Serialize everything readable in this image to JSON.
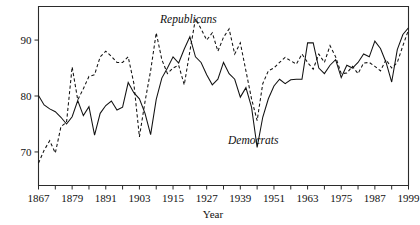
{
  "chart_data": {
    "type": "line",
    "title": "",
    "xlabel": "Year",
    "ylabel": "",
    "xlim": [
      1867,
      1999
    ],
    "ylim": [
      64,
      96
    ],
    "grid": false,
    "legend_position": "inline-annotation",
    "y_ticks": [
      70,
      80,
      90
    ],
    "x_ticks": [
      1867,
      1879,
      1891,
      1903,
      1915,
      1927,
      1939,
      1951,
      1963,
      1975,
      1987,
      1999
    ],
    "x_minor_ticks": [
      1873,
      1885,
      1897,
      1909,
      1921,
      1933,
      1945,
      1957,
      1969,
      1981,
      1993
    ],
    "x": [
      1867,
      1869,
      1871,
      1873,
      1875,
      1877,
      1879,
      1881,
      1883,
      1885,
      1887,
      1889,
      1891,
      1893,
      1895,
      1897,
      1899,
      1901,
      1903,
      1905,
      1907,
      1909,
      1911,
      1913,
      1915,
      1917,
      1919,
      1921,
      1923,
      1925,
      1927,
      1929,
      1931,
      1933,
      1935,
      1937,
      1939,
      1941,
      1943,
      1945,
      1947,
      1949,
      1951,
      1953,
      1955,
      1957,
      1959,
      1961,
      1963,
      1965,
      1967,
      1969,
      1971,
      1973,
      1975,
      1977,
      1979,
      1981,
      1983,
      1985,
      1987,
      1989,
      1991,
      1993,
      1995,
      1997,
      1999
    ],
    "series": [
      {
        "name": "Democrats",
        "style": "solid",
        "annotation": "Democrats",
        "values": [
          80.1,
          78.4,
          77.7,
          77.2,
          76.2,
          75.0,
          76.3,
          79.2,
          76.5,
          78.1,
          73.0,
          76.9,
          78.3,
          79.1,
          77.5,
          78.0,
          82.4,
          80.6,
          79.5,
          76.9,
          73.1,
          79.4,
          83.2,
          85.0,
          87.0,
          85.9,
          88.4,
          90.6,
          87.0,
          86.0,
          83.8,
          82.0,
          83.0,
          86.0,
          84.0,
          83.0,
          79.8,
          81.5,
          78.0,
          70.8,
          76.2,
          79.5,
          81.8,
          83.0,
          82.2,
          82.9,
          83.0,
          83.0,
          89.5,
          89.5,
          85.0,
          84.0,
          85.5,
          86.5,
          83.3,
          85.5,
          85.0,
          86.0,
          87.5,
          87.0,
          89.8,
          88.5,
          86.0,
          82.5,
          88.3,
          91.0,
          92.2
        ]
      },
      {
        "name": "Republicans",
        "style": "dashed",
        "annotation": "Republicans",
        "values": [
          68.0,
          70.3,
          72.0,
          69.8,
          74.5,
          75.3,
          85.2,
          79.3,
          81.3,
          83.5,
          83.8,
          87.0,
          88.0,
          87.1,
          86.0,
          86.0,
          87.0,
          82.3,
          72.7,
          79.0,
          84.5,
          91.3,
          86.5,
          84.0,
          85.0,
          85.5,
          82.0,
          88.0,
          93.8,
          92.0,
          90.0,
          91.3,
          88.0,
          90.5,
          92.0,
          87.5,
          89.5,
          84.5,
          79.5,
          75.6,
          82.2,
          84.5,
          85.0,
          86.0,
          86.9,
          86.3,
          85.7,
          87.5,
          86.0,
          84.8,
          87.5,
          86.0,
          89.0,
          87.0,
          84.0,
          84.1,
          85.3,
          84.0,
          85.9,
          86.0,
          85.3,
          84.5,
          86.5,
          85.0,
          86.0,
          89.0,
          91.8
        ]
      }
    ]
  },
  "annotations": {
    "republicans_label": "Republicans",
    "democrats_label": "Democrats"
  },
  "axes": {
    "x_title": "Year"
  }
}
